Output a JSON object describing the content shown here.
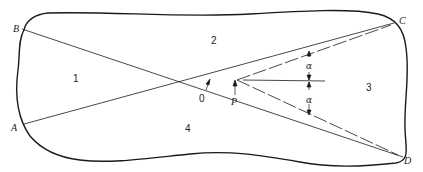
{
  "diagram": {
    "points": {
      "A": "A",
      "B": "B",
      "C": "C",
      "D": "D",
      "O": "0",
      "P": "P"
    },
    "regions": {
      "r1": "1",
      "r2": "2",
      "r3": "3",
      "r4": "4"
    },
    "angles": {
      "upper": "α",
      "lower": "α"
    },
    "colors": {
      "stroke": "#1a1a1a",
      "background": "#ffffff"
    }
  }
}
